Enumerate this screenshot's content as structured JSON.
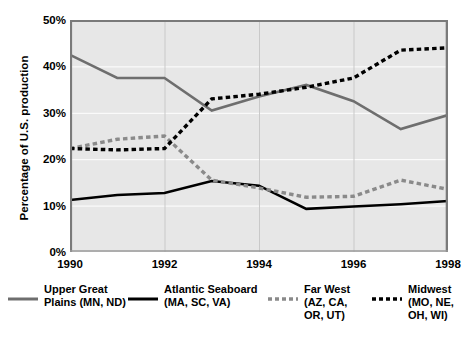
{
  "chart_data": {
    "type": "line",
    "title": "",
    "xlabel": "",
    "ylabel": "Percentage of U.S. production",
    "xlim": [
      1990,
      1998
    ],
    "ylim": [
      0,
      50
    ],
    "grid": true,
    "legend_position": "bottom",
    "x": [
      1990,
      1991,
      1992,
      1993,
      1994,
      1995,
      1996,
      1997,
      1998
    ],
    "x_tick_labels": [
      "1990",
      "1992",
      "1994",
      "1996",
      "1998"
    ],
    "x_tick_values": [
      1990,
      1992,
      1994,
      1996,
      1998
    ],
    "y_tick_labels": [
      "0%",
      "10%",
      "20%",
      "30%",
      "40%",
      "50%"
    ],
    "y_tick_values": [
      0,
      10,
      20,
      30,
      40,
      50
    ],
    "series": [
      {
        "name": "Upper Great Plains (MN, ND)",
        "short_name": "Upper Great Plains",
        "region_codes": "(MN, ND)",
        "style": "solid",
        "color": "#6e6e6e",
        "values": [
          42.5,
          37.5,
          37.5,
          30.5,
          33.5,
          36.0,
          32.5,
          26.5,
          29.5
        ]
      },
      {
        "name": "Atlantic Seaboard (MA, SC, VA)",
        "short_name": "Atlantic Seaboard",
        "region_codes": "(MA, SC, VA)",
        "style": "solid",
        "color": "#000000",
        "values": [
          11.2,
          12.3,
          12.7,
          15.3,
          14.3,
          9.3,
          9.8,
          10.3,
          11.0
        ]
      },
      {
        "name": "Far West (AZ, CA, OR, UT)",
        "short_name": "Far West",
        "region_codes": "(AZ, CA, OR, UT)",
        "style": "dashed",
        "color": "#8a8a8a",
        "values": [
          22.3,
          24.3,
          25.0,
          15.5,
          13.8,
          11.8,
          12.0,
          15.5,
          13.5
        ]
      },
      {
        "name": "Midwest (MO, NE, OH, WI)",
        "short_name": "Midwest",
        "region_codes": "(MO, NE, OH, WI)",
        "style": "dashed",
        "color": "#000000",
        "values": [
          22.3,
          22.0,
          22.3,
          33.0,
          34.0,
          35.5,
          37.5,
          43.5,
          44.0
        ]
      }
    ]
  },
  "legend": {
    "items": [
      {
        "label": "Upper Great\nPlains (MN, ND)",
        "color": "#6e6e6e",
        "style": "solid"
      },
      {
        "label": "Atlantic Seaboard\n(MA, SC, VA)",
        "color": "#000000",
        "style": "solid"
      },
      {
        "label": "Far West\n(AZ, CA,\nOR, UT)",
        "color": "#8a8a8a",
        "style": "dashed"
      },
      {
        "label": "Midwest\n(MO, NE,\nOH, WI)",
        "color": "#000000",
        "style": "dashed"
      }
    ]
  },
  "axis": {
    "y_title": "Percentage of U.S. production"
  },
  "style": {
    "plot_background": "#e7e7e7",
    "gridline_color": "#ffffff",
    "axis_line_color": "#7a7a7a",
    "page_background": "#ffffff"
  }
}
